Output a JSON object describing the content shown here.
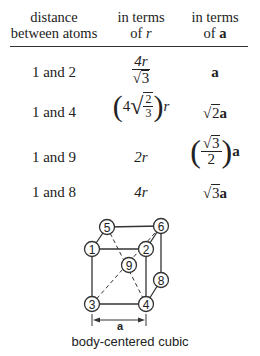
{
  "table": {
    "headers": [
      {
        "line1": "distance",
        "line2": "between atoms"
      },
      {
        "line1": "in terms",
        "line2_prefix": "of ",
        "line2_var": "r"
      },
      {
        "line1": "in terms",
        "line2_prefix": "of ",
        "line2_var": "a"
      }
    ],
    "rows": [
      {
        "atoms": "1 and 2",
        "r_expr": "4r/√3",
        "a_expr": "a"
      },
      {
        "atoms": "1 and 4",
        "r_expr": "(4√(2/3)) r",
        "a_expr": "√2a"
      },
      {
        "atoms": "1 and 9",
        "r_expr": "2r",
        "a_expr": "(√3/2) a"
      },
      {
        "atoms": "1 and 8",
        "r_expr": "4r",
        "a_expr": "√3a"
      }
    ],
    "parts": {
      "r1_num": "4r",
      "r1_den": "3",
      "r2_coef": "4",
      "r2_num": "2",
      "r2_den": "3",
      "r2_var": "r",
      "r3": "2r",
      "r4": "4r",
      "a1": "a",
      "a2_rad": "2",
      "a2_var": "a",
      "a3_num": "3",
      "a3_den": "2",
      "a3_var": "a",
      "a4_rad": "3",
      "a4_var": "a",
      "sqrt": "√",
      "lparen": "(",
      "rparen": ")"
    }
  },
  "diagram": {
    "atoms": [
      {
        "label": "5",
        "x": 107,
        "y": 227
      },
      {
        "label": "6",
        "x": 161,
        "y": 226
      },
      {
        "label": "1",
        "x": 92,
        "y": 249
      },
      {
        "label": "2",
        "x": 146,
        "y": 249
      },
      {
        "label": "9",
        "x": 129,
        "y": 265
      },
      {
        "label": "8",
        "x": 161,
        "y": 280
      },
      {
        "label": "3",
        "x": 92,
        "y": 304
      },
      {
        "label": "4",
        "x": 146,
        "y": 304
      }
    ],
    "dimension_label": "a",
    "caption": "body-centered cubic"
  }
}
